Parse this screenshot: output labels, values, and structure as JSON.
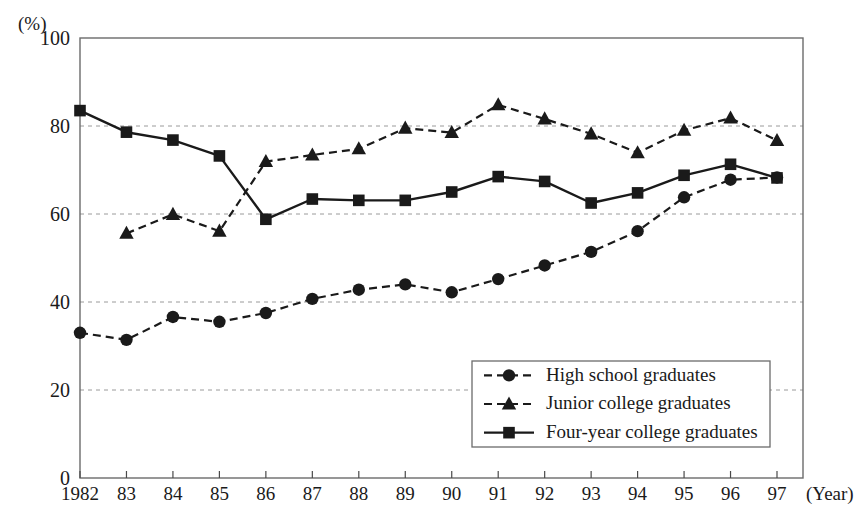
{
  "chart_data": {
    "type": "line",
    "title": "",
    "xlabel": "(Year)",
    "ylabel": "(%)",
    "x": [
      1982,
      1983,
      1984,
      1985,
      1986,
      1987,
      1988,
      1989,
      1990,
      1991,
      1992,
      1993,
      1994,
      1995,
      1996,
      1997
    ],
    "categories": [
      "1982",
      "83",
      "84",
      "85",
      "86",
      "87",
      "88",
      "89",
      "90",
      "91",
      "92",
      "93",
      "94",
      "95",
      "96",
      "97"
    ],
    "xtick_labels": [
      "1982",
      "83",
      "84",
      "85",
      "86",
      "87",
      "88",
      "89",
      "90",
      "91",
      "92",
      "93",
      "94",
      "95",
      "96",
      "97"
    ],
    "ytick_labels": [
      "0",
      "20",
      "40",
      "60",
      "80",
      "100"
    ],
    "yticks": [
      0,
      20,
      40,
      60,
      80,
      100
    ],
    "ylim": [
      0,
      100
    ],
    "grid": "horizontal-dashed",
    "legend_position": "inside-lower-right",
    "series": [
      {
        "name": "High school graduates",
        "marker": "circle",
        "linestyle": "dashed",
        "color": "#1a1a1a",
        "values": [
          33.0,
          31.4,
          36.6,
          35.5,
          37.5,
          40.7,
          42.8,
          44.0,
          42.2,
          45.2,
          48.3,
          51.4,
          56.1,
          63.8,
          67.8,
          68.3
        ]
      },
      {
        "name": "Junior college graduates",
        "marker": "triangle",
        "linestyle": "dashed",
        "color": "#1a1a1a",
        "values": [
          null,
          55.6,
          59.9,
          56.1,
          71.9,
          73.4,
          74.8,
          79.5,
          78.5,
          84.8,
          81.6,
          78.2,
          73.9,
          79.0,
          81.8,
          76.7
        ]
      },
      {
        "name": "Four-year college graduates",
        "marker": "square",
        "linestyle": "solid",
        "color": "#1a1a1a",
        "values": [
          83.5,
          78.6,
          76.8,
          73.2,
          58.8,
          63.4,
          63.1,
          63.1,
          65.0,
          68.5,
          67.4,
          62.5,
          64.8,
          68.8,
          71.3,
          68.2
        ]
      }
    ]
  },
  "legend": {
    "items": [
      {
        "label": "High school graduates",
        "marker": "circle",
        "linestyle": "dashed"
      },
      {
        "label": "Junior college graduates",
        "marker": "triangle",
        "linestyle": "dashed"
      },
      {
        "label": "Four-year college graduates",
        "marker": "square",
        "linestyle": "solid"
      }
    ]
  },
  "axes": {
    "y_unit": "(%)",
    "x_unit": "(Year)"
  },
  "colors": {
    "ink": "#1a1a1a",
    "frame": "#6b6b6b",
    "grid": "#9a9a9a",
    "background": "#ffffff"
  }
}
